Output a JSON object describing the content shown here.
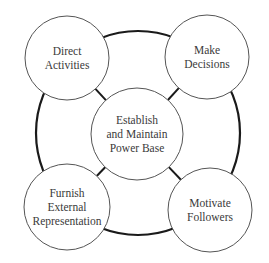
{
  "diagram": {
    "type": "hub-and-ring",
    "colors": {
      "background": "#ffffff",
      "ring": "#1a1a1a",
      "circle_stroke": "#555555",
      "connector": "#1a1a1a",
      "text": "#3a3a3a"
    },
    "ring": {
      "cx": 138,
      "cy": 133,
      "r": 102
    },
    "center": {
      "cx": 137,
      "cy": 134,
      "r": 46,
      "lines": [
        "Establish",
        "and Maintain",
        "Power Base"
      ]
    },
    "nodes": [
      {
        "id": "direct-activities",
        "cx": 67,
        "cy": 58,
        "r": 42,
        "lines": [
          "Direct",
          "Activities"
        ]
      },
      {
        "id": "make-decisions",
        "cx": 207,
        "cy": 57,
        "r": 42,
        "lines": [
          "Make",
          "Decisions"
        ]
      },
      {
        "id": "furnish-external-representation",
        "cx": 67,
        "cy": 207,
        "r": 43,
        "lines": [
          "Furnish",
          "External",
          "Representation"
        ]
      },
      {
        "id": "motivate-followers",
        "cx": 210,
        "cy": 210,
        "r": 42,
        "lines": [
          "Motivate",
          "Followers"
        ]
      }
    ]
  }
}
